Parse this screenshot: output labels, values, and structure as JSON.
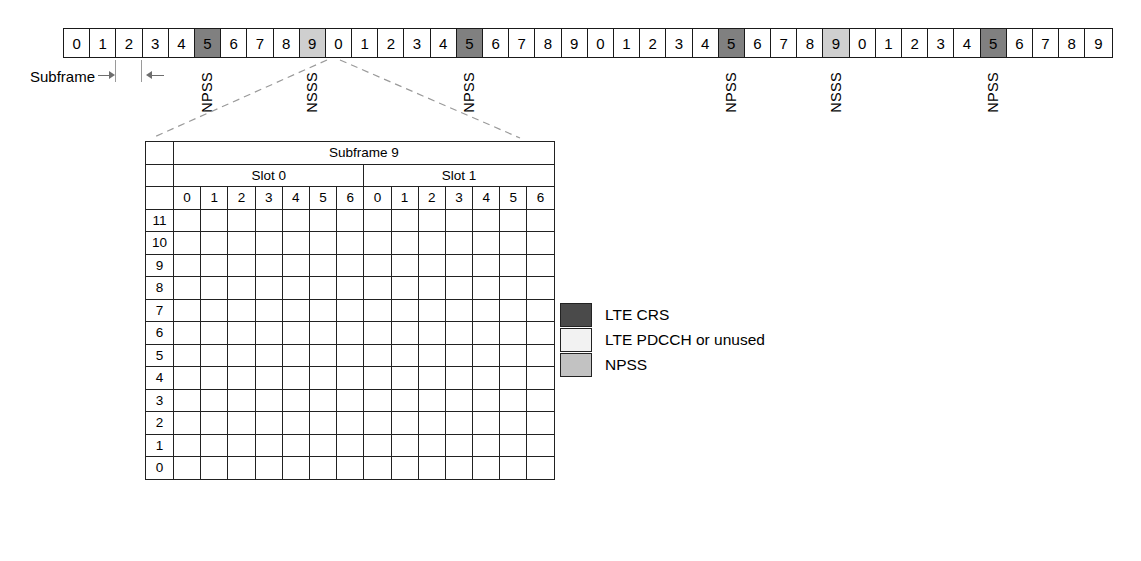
{
  "strip": {
    "cells": [
      {
        "label": "0",
        "type": "plain"
      },
      {
        "label": "1",
        "type": "plain"
      },
      {
        "label": "2",
        "type": "plain"
      },
      {
        "label": "3",
        "type": "plain"
      },
      {
        "label": "4",
        "type": "plain"
      },
      {
        "label": "5",
        "type": "npss"
      },
      {
        "label": "6",
        "type": "plain"
      },
      {
        "label": "7",
        "type": "plain"
      },
      {
        "label": "8",
        "type": "plain"
      },
      {
        "label": "9",
        "type": "nsss"
      },
      {
        "label": "0",
        "type": "plain"
      },
      {
        "label": "1",
        "type": "plain"
      },
      {
        "label": "2",
        "type": "plain"
      },
      {
        "label": "3",
        "type": "plain"
      },
      {
        "label": "4",
        "type": "plain"
      },
      {
        "label": "5",
        "type": "npss"
      },
      {
        "label": "6",
        "type": "plain"
      },
      {
        "label": "7",
        "type": "plain"
      },
      {
        "label": "8",
        "type": "plain"
      },
      {
        "label": "9",
        "type": "plain"
      },
      {
        "label": "0",
        "type": "plain"
      },
      {
        "label": "1",
        "type": "plain"
      },
      {
        "label": "2",
        "type": "plain"
      },
      {
        "label": "3",
        "type": "plain"
      },
      {
        "label": "4",
        "type": "plain"
      },
      {
        "label": "5",
        "type": "npss"
      },
      {
        "label": "6",
        "type": "plain"
      },
      {
        "label": "7",
        "type": "plain"
      },
      {
        "label": "8",
        "type": "plain"
      },
      {
        "label": "9",
        "type": "nsss"
      },
      {
        "label": "0",
        "type": "plain"
      },
      {
        "label": "1",
        "type": "plain"
      },
      {
        "label": "2",
        "type": "plain"
      },
      {
        "label": "3",
        "type": "plain"
      },
      {
        "label": "4",
        "type": "plain"
      },
      {
        "label": "5",
        "type": "npss"
      },
      {
        "label": "6",
        "type": "plain"
      },
      {
        "label": "7",
        "type": "plain"
      },
      {
        "label": "8",
        "type": "plain"
      },
      {
        "label": "9",
        "type": "plain"
      }
    ],
    "caption": "Subframe",
    "markers": [
      {
        "label": "NPSS",
        "cell_index": 5
      },
      {
        "label": "NSSS",
        "cell_index": 9
      },
      {
        "label": "NPSS",
        "cell_index": 15
      },
      {
        "label": "NPSS",
        "cell_index": 25
      },
      {
        "label": "NSSS",
        "cell_index": 29
      },
      {
        "label": "NPSS",
        "cell_index": 35
      }
    ]
  },
  "detail": {
    "title": "Subframe 9",
    "slots": [
      {
        "label": "Slot 0",
        "symbols": [
          "0",
          "1",
          "2",
          "3",
          "4",
          "5",
          "6"
        ]
      },
      {
        "label": "Slot 1",
        "symbols": [
          "0",
          "1",
          "2",
          "3",
          "4",
          "5",
          "6"
        ]
      }
    ],
    "row_labels": [
      "11",
      "10",
      "9",
      "8",
      "7",
      "6",
      "5",
      "4",
      "3",
      "2",
      "1",
      "0"
    ],
    "grid": [
      [
        "crs",
        "crs",
        "pdcch",
        "npss",
        "crs",
        "npss",
        "npss",
        "crs",
        "crs",
        "npss",
        "npss",
        "crs",
        "npss",
        "npss"
      ],
      [
        "pdcch",
        "pdcch",
        "pdcch",
        "npss",
        "npss",
        "npss",
        "npss",
        "npss",
        "npss",
        "npss",
        "npss",
        "npss",
        "npss",
        "npss"
      ],
      [
        "pdcch",
        "pdcch",
        "pdcch",
        "npss",
        "npss",
        "npss",
        "npss",
        "npss",
        "npss",
        "npss",
        "npss",
        "npss",
        "npss",
        "npss"
      ],
      [
        "crs",
        "crs",
        "pdcch",
        "npss",
        "crs",
        "npss",
        "npss",
        "crs",
        "crs",
        "npss",
        "npss",
        "crs",
        "npss",
        "npss"
      ],
      [
        "pdcch",
        "pdcch",
        "pdcch",
        "npss",
        "npss",
        "npss",
        "npss",
        "npss",
        "npss",
        "npss",
        "npss",
        "npss",
        "npss",
        "npss"
      ],
      [
        "pdcch",
        "pdcch",
        "pdcch",
        "npss",
        "npss",
        "npss",
        "npss",
        "npss",
        "npss",
        "npss",
        "npss",
        "npss",
        "npss",
        "npss"
      ],
      [
        "crs",
        "crs",
        "pdcch",
        "npss",
        "crs",
        "npss",
        "npss",
        "crs",
        "crs",
        "npss",
        "npss",
        "crs",
        "npss",
        "npss"
      ],
      [
        "pdcch",
        "pdcch",
        "pdcch",
        "npss",
        "npss",
        "npss",
        "npss",
        "npss",
        "npss",
        "npss",
        "npss",
        "npss",
        "npss",
        "npss"
      ],
      [
        "pdcch",
        "pdcch",
        "pdcch",
        "npss",
        "npss",
        "npss",
        "npss",
        "npss",
        "npss",
        "npss",
        "npss",
        "npss",
        "npss",
        "npss"
      ],
      [
        "crs",
        "crs",
        "pdcch",
        "npss",
        "crs",
        "npss",
        "npss",
        "crs",
        "crs",
        "npss",
        "npss",
        "crs",
        "npss",
        "npss"
      ],
      [
        "pdcch",
        "pdcch",
        "pdcch",
        "npss",
        "npss",
        "npss",
        "npss",
        "npss",
        "npss",
        "npss",
        "npss",
        "npss",
        "npss",
        "npss"
      ],
      [
        "pdcch",
        "pdcch",
        "pdcch",
        "npss",
        "npss",
        "npss",
        "npss",
        "npss",
        "npss",
        "npss",
        "npss",
        "npss",
        "npss",
        "npss"
      ]
    ]
  },
  "legend": {
    "items": [
      {
        "label": "LTE CRS",
        "kind": "crs",
        "color": "#4a4a4a"
      },
      {
        "label": "LTE PDCCH or unused",
        "kind": "pdcch",
        "color": "#f2f2f2"
      },
      {
        "label": "NPSS",
        "kind": "npss",
        "color": "#c2c2c2"
      }
    ]
  }
}
